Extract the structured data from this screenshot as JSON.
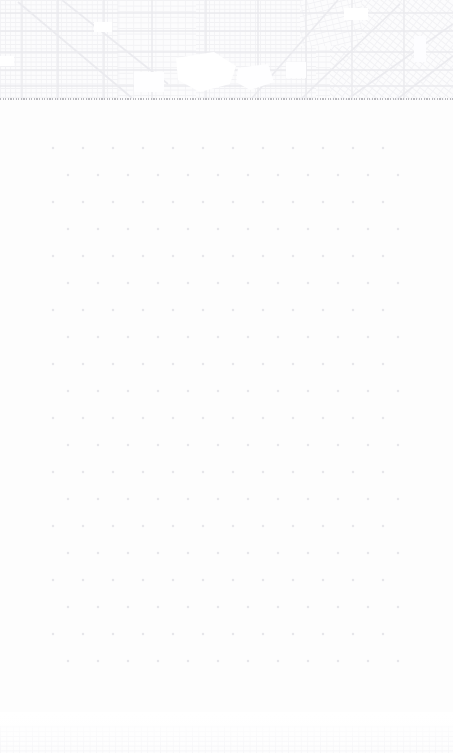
{
  "document": {
    "title": "Faded Map Sheet",
    "page_background": "#fdfdfd",
    "width": 453,
    "height": 753
  },
  "map_strip": {
    "name": "faded-city-map",
    "description": "Very light grayscale street-grid map occupying the top band of the page",
    "bounds": {
      "x": 0,
      "y": 0,
      "width": 453,
      "height": 100
    },
    "background_color": "#fbfbfc",
    "street_color": "#eeeef1",
    "major_street_color": "#e4e4e8",
    "block_fill_color": "#f7f7f9",
    "open_space_color": "#ffffff",
    "features": [
      {
        "name": "dense-street-grid",
        "kind": "grid"
      },
      {
        "name": "diagonal-avenue-left",
        "kind": "diagonal-road"
      },
      {
        "name": "diagonal-avenue-right",
        "kind": "diagonal-road"
      },
      {
        "name": "central-open-space",
        "kind": "park"
      },
      {
        "name": "secondary-open-space",
        "kind": "park"
      },
      {
        "name": "rotated-district-right",
        "kind": "rotated-grid"
      }
    ]
  },
  "divider": {
    "name": "dotted-rule",
    "y": 99,
    "color": "#b9b9bd",
    "style": "dotted",
    "thickness": 1
  },
  "dot_grid": {
    "name": "staggered-dot-grid",
    "description": "Large field of very faint gray dots arranged in a staggered (offset) lattice",
    "bounds": {
      "x": 0,
      "y": 100,
      "width": 453,
      "height": 610
    },
    "dot_color": "#e6e6ea",
    "dot_radius": 1.25,
    "first_dot_x": 53,
    "first_dot_y": 48,
    "spacing_x": 30,
    "spacing_y": 27,
    "row_offset_x": 15,
    "columns": 12,
    "rows": 20,
    "background_color": "#fdfdfd"
  },
  "bottom_band": {
    "name": "faint-texture-band",
    "description": "Barely visible mottled texture strip along the bottom edge, the top of another map sheet",
    "bounds": {
      "x": 0,
      "y": 712,
      "width": 453,
      "height": 41
    },
    "color": "#f4f4f6"
  }
}
